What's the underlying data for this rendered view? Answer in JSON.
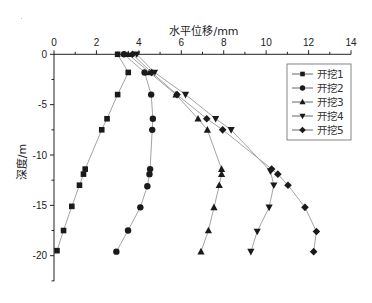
{
  "chart_data": {
    "type": "line",
    "title": "",
    "xlabel": "水平位移/mm",
    "ylabel": "深度/m",
    "xlim": [
      0,
      14
    ],
    "ylim": [
      -22.5,
      0
    ],
    "x_ticks": [
      0,
      2,
      4,
      6,
      8,
      10,
      12,
      14
    ],
    "y_ticks": [
      0,
      -5,
      -10,
      -15,
      -20
    ],
    "x_axis_position": "top",
    "grid": false,
    "legend_position": "upper right",
    "series": [
      {
        "name": "开挖1",
        "marker": "square",
        "points": [
          [
            3.0,
            0
          ],
          [
            3.5,
            -1.8
          ],
          [
            3.0,
            -4.0
          ],
          [
            2.5,
            -6.4
          ],
          [
            2.25,
            -7.5
          ],
          [
            1.47,
            -11.4
          ],
          [
            1.39,
            -11.9
          ],
          [
            1.2,
            -13.0
          ],
          [
            0.84,
            -15.1
          ],
          [
            0.45,
            -17.5
          ],
          [
            0.14,
            -19.5
          ]
        ]
      },
      {
        "name": "开挖2",
        "marker": "circle",
        "points": [
          [
            3.3,
            0
          ],
          [
            4.27,
            -1.8
          ],
          [
            4.58,
            -4.0
          ],
          [
            4.66,
            -6.4
          ],
          [
            4.63,
            -7.5
          ],
          [
            4.53,
            -11.4
          ],
          [
            4.5,
            -11.9
          ],
          [
            4.4,
            -13.1
          ],
          [
            4.07,
            -15.2
          ],
          [
            3.49,
            -17.5
          ],
          [
            2.94,
            -19.6
          ]
        ]
      },
      {
        "name": "开挖3",
        "marker": "triangle-up",
        "points": [
          [
            3.5,
            0
          ],
          [
            4.5,
            -1.8
          ],
          [
            5.75,
            -4.0
          ],
          [
            6.79,
            -6.4
          ],
          [
            7.23,
            -7.5
          ],
          [
            7.9,
            -11.4
          ],
          [
            7.9,
            -11.9
          ],
          [
            7.79,
            -13.0
          ],
          [
            7.54,
            -15.2
          ],
          [
            7.28,
            -17.5
          ],
          [
            6.93,
            -19.6
          ]
        ]
      },
      {
        "name": "开挖4",
        "marker": "triangle-down",
        "points": [
          [
            3.9,
            0
          ],
          [
            4.74,
            -1.8
          ],
          [
            6.2,
            -4.0
          ],
          [
            7.62,
            -6.4
          ],
          [
            8.35,
            -7.5
          ],
          [
            10.2,
            -11.6
          ],
          [
            10.36,
            -13.0
          ],
          [
            10.14,
            -15.2
          ],
          [
            9.58,
            -17.6
          ],
          [
            9.28,
            -19.6
          ]
        ]
      },
      {
        "name": "开挖5",
        "marker": "diamond",
        "points": [
          [
            3.7,
            0
          ],
          [
            4.6,
            -1.8
          ],
          [
            5.8,
            -4.0
          ],
          [
            7.2,
            -6.4
          ],
          [
            7.95,
            -7.5
          ],
          [
            10.26,
            -11.4
          ],
          [
            10.55,
            -11.9
          ],
          [
            11.03,
            -13.0
          ],
          [
            11.83,
            -15.2
          ],
          [
            12.37,
            -17.6
          ],
          [
            12.24,
            -19.6
          ]
        ]
      }
    ]
  },
  "layout": {
    "plot_left": 54,
    "plot_right": 351,
    "y0_px": 54.3,
    "px_per_y": 10.07,
    "axis_bottom_px": 281,
    "line_color": "#999999",
    "marker_color": "#1a1a1a",
    "axis_color": "#222222",
    "legend_box": {
      "x": 287,
      "y": 64,
      "w": 64,
      "h": 76
    }
  }
}
